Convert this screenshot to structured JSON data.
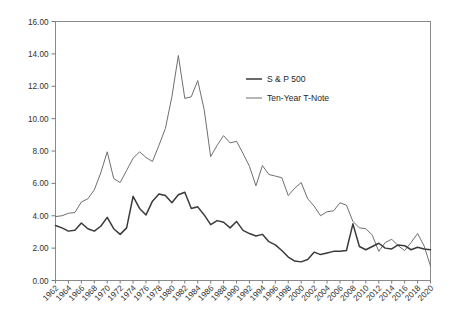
{
  "chart_data": {
    "type": "line",
    "title": "",
    "subtitle": "",
    "xlabel": "",
    "ylabel": "",
    "xlim": [
      1962,
      2020
    ],
    "ylim": [
      0.0,
      16.0
    ],
    "grid": false,
    "legend_position": "top-right-inside",
    "y_ticks": [
      "0.00",
      "2.00",
      "4.00",
      "6.00",
      "8.00",
      "10.00",
      "12.00",
      "14.00",
      "16.00"
    ],
    "y_tick_values": [
      0,
      2,
      4,
      6,
      8,
      10,
      12,
      14,
      16
    ],
    "x_ticks": [
      "1962",
      "1964",
      "1966",
      "1968",
      "1970",
      "1972",
      "1974",
      "1976",
      "1978",
      "1980",
      "1982",
      "1984",
      "1986",
      "1988",
      "1990",
      "1992",
      "1994",
      "1996",
      "1998",
      "2000",
      "2002",
      "2004",
      "2006",
      "2008",
      "2010",
      "2012",
      "2014",
      "2016",
      "2018",
      "2020"
    ],
    "x_tick_values": [
      1962,
      1964,
      1966,
      1968,
      1970,
      1972,
      1974,
      1976,
      1978,
      1980,
      1982,
      1984,
      1986,
      1988,
      1990,
      1992,
      1994,
      1996,
      1998,
      2000,
      2002,
      2004,
      2006,
      2008,
      2010,
      2012,
      2014,
      2016,
      2018,
      2020
    ],
    "x": [
      1962,
      1963,
      1964,
      1965,
      1966,
      1967,
      1968,
      1969,
      1970,
      1971,
      1972,
      1973,
      1974,
      1975,
      1976,
      1977,
      1978,
      1979,
      1980,
      1981,
      1982,
      1983,
      1984,
      1985,
      1986,
      1987,
      1988,
      1989,
      1990,
      1991,
      1992,
      1993,
      1994,
      1995,
      1996,
      1997,
      1998,
      1999,
      2000,
      2001,
      2002,
      2003,
      2004,
      2005,
      2006,
      2007,
      2008,
      2009,
      2010,
      2011,
      2012,
      2013,
      2014,
      2015,
      2016,
      2017,
      2018,
      2019,
      2020
    ],
    "series": [
      {
        "name": "S & P 500",
        "color": "#3a3a3a",
        "width": 1.5,
        "values": [
          3.4,
          3.25,
          3.05,
          3.1,
          3.55,
          3.2,
          3.05,
          3.35,
          3.9,
          3.2,
          2.85,
          3.25,
          5.2,
          4.45,
          4.05,
          4.9,
          5.35,
          5.25,
          4.8,
          5.3,
          5.45,
          4.45,
          4.55,
          4.05,
          3.45,
          3.7,
          3.6,
          3.25,
          3.65,
          3.1,
          2.9,
          2.75,
          2.85,
          2.4,
          2.2,
          1.85,
          1.45,
          1.2,
          1.15,
          1.3,
          1.75,
          1.6,
          1.7,
          1.8,
          1.8,
          1.85,
          3.5,
          2.1,
          1.9,
          2.1,
          2.3,
          2.0,
          1.95,
          2.2,
          2.15,
          1.9,
          2.05,
          1.95,
          1.9
        ]
      },
      {
        "name": "Ten-Year T-Note",
        "color": "#6f6f6f",
        "width": 1.0,
        "values": [
          3.95,
          4.0,
          4.15,
          4.2,
          4.85,
          5.05,
          5.6,
          6.65,
          7.95,
          6.3,
          6.05,
          6.8,
          7.55,
          7.95,
          7.6,
          7.35,
          8.35,
          9.4,
          11.35,
          13.9,
          11.25,
          11.35,
          12.35,
          10.55,
          7.65,
          8.35,
          8.95,
          8.5,
          8.6,
          7.85,
          7.05,
          5.85,
          7.1,
          6.55,
          6.45,
          6.35,
          5.25,
          5.7,
          6.05,
          5.05,
          4.6,
          4.0,
          4.25,
          4.3,
          4.8,
          4.65,
          3.65,
          3.25,
          3.2,
          2.8,
          1.8,
          2.35,
          2.55,
          2.15,
          1.85,
          2.35,
          2.9,
          2.15,
          0.9
        ]
      }
    ],
    "legend": [
      {
        "label": "S & P 500",
        "color": "#3a3a3a",
        "width": 1.5
      },
      {
        "label": "Ten-Year T-Note",
        "color": "#6f6f6f",
        "width": 1.0
      }
    ]
  }
}
